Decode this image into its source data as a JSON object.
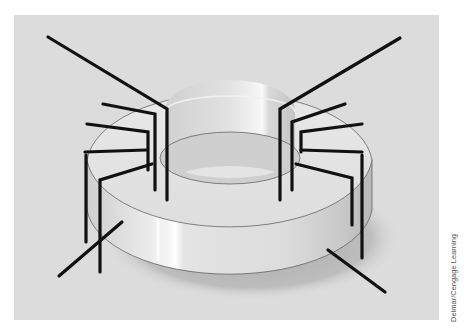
{
  "figure": {
    "background_color": "#dcdcdc",
    "core_color": "#e6e6e6",
    "wire_color": "#111111",
    "windings": [
      {
        "name": "left-winding",
        "turns": 4,
        "leads": 2
      },
      {
        "name": "right-winding",
        "turns": 4,
        "leads": 2
      }
    ]
  },
  "credit": {
    "text": "Delmar/Cengage Learning"
  }
}
